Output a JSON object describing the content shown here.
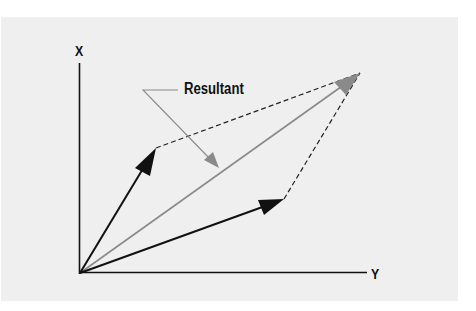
{
  "diagram": {
    "type": "vector-parallelogram",
    "axes": {
      "vertical_label": "X",
      "horizontal_label": "Y"
    },
    "annotation": {
      "label": "Resultant"
    },
    "colors": {
      "background": "#ffffff",
      "panel": "#efefef",
      "vectors": "#111111",
      "resultant": "#8a8a8a",
      "leader": "#8a8a8a",
      "dashed": "#222222"
    },
    "elements": [
      {
        "name": "vector-a",
        "from": [
          80,
          273
        ],
        "to": [
          156,
          148
        ],
        "style": "solid-black-arrow"
      },
      {
        "name": "vector-b",
        "from": [
          80,
          273
        ],
        "to": [
          284,
          199
        ],
        "style": "solid-black-arrow"
      },
      {
        "name": "resultant",
        "from": [
          80,
          273
        ],
        "to": [
          360,
          73
        ],
        "style": "solid-gray-arrow"
      },
      {
        "name": "dashed-a-to-tip",
        "from": [
          156,
          148
        ],
        "to": [
          360,
          73
        ],
        "style": "dashed"
      },
      {
        "name": "dashed-b-to-tip",
        "from": [
          284,
          199
        ],
        "to": [
          360,
          73
        ],
        "style": "dashed"
      }
    ]
  }
}
